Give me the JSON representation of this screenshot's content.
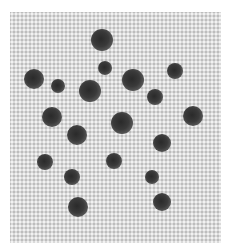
{
  "image": {
    "description": "Grayscale photo of woven fabric with dark round spots",
    "background_color": "#ffffff",
    "fabric_color": "#d9d9d9",
    "spot_color": "#333333"
  },
  "dots": [
    {
      "x": 102,
      "y": 40,
      "r": 11
    },
    {
      "x": 105,
      "y": 68,
      "r": 7
    },
    {
      "x": 34,
      "y": 79,
      "r": 10
    },
    {
      "x": 58,
      "y": 86,
      "r": 7
    },
    {
      "x": 90,
      "y": 91,
      "r": 11
    },
    {
      "x": 133,
      "y": 80,
      "r": 11
    },
    {
      "x": 175,
      "y": 71,
      "r": 8
    },
    {
      "x": 155,
      "y": 97,
      "r": 8
    },
    {
      "x": 52,
      "y": 117,
      "r": 10
    },
    {
      "x": 122,
      "y": 123,
      "r": 11
    },
    {
      "x": 193,
      "y": 116,
      "r": 10
    },
    {
      "x": 77,
      "y": 135,
      "r": 10
    },
    {
      "x": 162,
      "y": 143,
      "r": 9
    },
    {
      "x": 45,
      "y": 162,
      "r": 8
    },
    {
      "x": 114,
      "y": 161,
      "r": 8
    },
    {
      "x": 72,
      "y": 177,
      "r": 8
    },
    {
      "x": 152,
      "y": 177,
      "r": 7
    },
    {
      "x": 78,
      "y": 207,
      "r": 10
    },
    {
      "x": 162,
      "y": 202,
      "r": 9
    }
  ]
}
